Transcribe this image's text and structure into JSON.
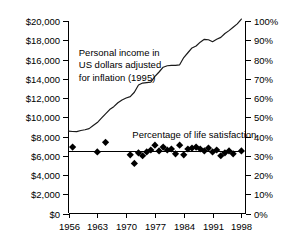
{
  "chart_data": {
    "type": "line",
    "title": "",
    "subtitle": "",
    "xlabel": "",
    "ylabel": "",
    "grid": false,
    "legend_position": "inline-annotations",
    "xlim": [
      1956,
      1999
    ],
    "x_ticks": [
      "1956",
      "1963",
      "1970",
      "1977",
      "1984",
      "1991",
      "1998"
    ],
    "x_tick_values": [
      1956,
      1963,
      1970,
      1977,
      1984,
      1991,
      1998
    ],
    "left_axis": {
      "label": "",
      "ylim": [
        0,
        20000
      ],
      "ticks": [
        "$0",
        "$2,000",
        "$4,000",
        "$6,000",
        "$8,000",
        "$10,000",
        "$12,000",
        "$14,000",
        "$16,000",
        "$18,000",
        "$20,000"
      ],
      "tick_values": [
        0,
        2000,
        4000,
        6000,
        8000,
        10000,
        12000,
        14000,
        16000,
        18000,
        20000
      ]
    },
    "right_axis": {
      "label": "",
      "ylim": [
        0,
        100
      ],
      "ticks": [
        "0%",
        "10%",
        "20%",
        "30%",
        "40%",
        "50%",
        "60%",
        "70%",
        "80%",
        "90%",
        "100%"
      ],
      "tick_values": [
        0,
        10,
        20,
        30,
        40,
        50,
        60,
        70,
        80,
        90,
        100
      ]
    },
    "annotations": [
      {
        "name": "income-annotation",
        "lines": [
          "Personal income in",
          "US dollars adjusted",
          "for inflation (1995)"
        ],
        "x": 1958.5,
        "y": 16400
      },
      {
        "name": "satisfaction-annotation",
        "lines": [
          "Percentage of life satisfaction"
        ],
        "x": 1971.5,
        "y": 8000
      }
    ],
    "series": [
      {
        "name": "Personal income in US dollars adjusted for inflation (1995)",
        "axis": "left",
        "type": "line",
        "x": [
          1956,
          1957,
          1958,
          1959,
          1960,
          1961,
          1962,
          1963,
          1964,
          1965,
          1966,
          1967,
          1968,
          1969,
          1970,
          1971,
          1972,
          1973,
          1974,
          1975,
          1976,
          1977,
          1978,
          1979,
          1980,
          1981,
          1982,
          1983,
          1984,
          1985,
          1986,
          1987,
          1988,
          1989,
          1990,
          1991,
          1992,
          1993,
          1994,
          1995,
          1996,
          1997,
          1998
        ],
        "values": [
          8550,
          8520,
          8500,
          8620,
          8700,
          8820,
          9150,
          9450,
          9900,
          10350,
          10800,
          11100,
          11500,
          11800,
          12000,
          12150,
          12600,
          13350,
          13550,
          13600,
          13650,
          14250,
          14700,
          15200,
          15350,
          15400,
          15400,
          15450,
          16200,
          16700,
          17200,
          17400,
          17800,
          18100,
          18050,
          17850,
          18100,
          18300,
          18700,
          19000,
          19350,
          19700,
          20200
        ]
      },
      {
        "name": "Percentage of life satisfaction",
        "axis": "right",
        "type": "scatter",
        "marker": "diamond",
        "x": [
          1957,
          1963,
          1965,
          1971,
          1972,
          1973,
          1974,
          1975,
          1976,
          1977,
          1978,
          1979,
          1980,
          1981,
          1982,
          1983,
          1984,
          1985,
          1986,
          1987,
          1988,
          1989,
          1990,
          1991,
          1992,
          1993,
          1994,
          1995,
          1996,
          1998
        ],
        "values": [
          34.5,
          32.0,
          37.0,
          30.5,
          26.0,
          31.5,
          30.0,
          32.0,
          33.0,
          35.5,
          32.5,
          34.5,
          33.0,
          33.5,
          31.0,
          35.5,
          30.5,
          33.5,
          34.0,
          34.5,
          33.5,
          32.5,
          34.0,
          32.0,
          33.0,
          30.0,
          31.5,
          32.5,
          31.0,
          32.5
        ]
      },
      {
        "name": "Percentage of life satisfaction trend",
        "axis": "right",
        "type": "line",
        "values": [
          32.3,
          32.3
        ],
        "x": [
          1956,
          1998
        ]
      }
    ]
  }
}
